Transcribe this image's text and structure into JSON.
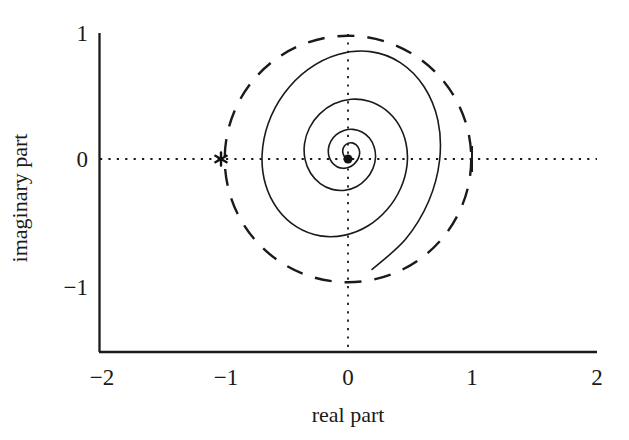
{
  "chart_data": {
    "type": "line",
    "title": "",
    "xlabel": "real part",
    "ylabel": "imaginary part",
    "xlim": [
      -2,
      2
    ],
    "ylim": [
      -1.53,
      1
    ],
    "xticks": [
      -2,
      -1,
      0,
      1,
      2
    ],
    "xtick_labels": [
      "−2",
      "−1",
      "0",
      "1",
      "2"
    ],
    "yticks": [
      -1,
      0,
      1
    ],
    "ytick_labels": [
      "−1",
      "0",
      "1"
    ],
    "grid": false,
    "legend": null,
    "series": [
      {
        "name": "logarithmic spiral (root locus)",
        "style": "solid",
        "color": "#1a1a1a",
        "linewidth": 1.6,
        "description": "Spiral winding outward counter-clockwise from the origin, crossing the unit circle near (-0.69, -0.72) and exiting the bottom of the axes at about (-1.23, -1.53)",
        "points": [
          [
            0.0,
            0.0
          ],
          [
            -0.022,
            0.012
          ],
          [
            -0.038,
            0.038
          ],
          [
            -0.042,
            0.071
          ],
          [
            -0.029,
            0.103
          ],
          [
            -0.002,
            0.124
          ],
          [
            0.033,
            0.128
          ],
          [
            0.066,
            0.112
          ],
          [
            0.088,
            0.08
          ],
          [
            0.093,
            0.04
          ],
          [
            0.079,
            -0.002
          ],
          [
            0.049,
            -0.04
          ],
          [
            0.007,
            -0.066
          ],
          [
            -0.04,
            -0.074
          ],
          [
            -0.088,
            -0.061
          ],
          [
            -0.128,
            -0.028
          ],
          [
            -0.153,
            0.022
          ],
          [
            -0.157,
            0.082
          ],
          [
            -0.137,
            0.142
          ],
          [
            -0.094,
            0.194
          ],
          [
            -0.032,
            0.227
          ],
          [
            0.04,
            0.235
          ],
          [
            0.112,
            0.214
          ],
          [
            0.172,
            0.166
          ],
          [
            0.21,
            0.095
          ],
          [
            0.221,
            0.012
          ],
          [
            0.2,
            -0.076
          ],
          [
            0.148,
            -0.157
          ],
          [
            0.071,
            -0.218
          ],
          [
            -0.024,
            -0.248
          ],
          [
            -0.127,
            -0.241
          ],
          [
            -0.223,
            -0.195
          ],
          [
            -0.3,
            -0.113
          ],
          [
            -0.345,
            -0.003
          ],
          [
            -0.349,
            0.122
          ],
          [
            -0.309,
            0.248
          ],
          [
            -0.227,
            0.358
          ],
          [
            -0.112,
            0.438
          ],
          [
            0.026,
            0.474
          ],
          [
            0.169,
            0.459
          ],
          [
            0.3,
            0.392
          ],
          [
            0.405,
            0.277
          ],
          [
            0.466,
            0.125
          ],
          [
            0.474,
            -0.05
          ],
          [
            0.423,
            -0.232
          ],
          [
            0.316,
            -0.399
          ],
          [
            0.162,
            -0.53
          ],
          [
            -0.024,
            -0.604
          ],
          [
            -0.222,
            -0.61
          ],
          [
            -0.409,
            -0.541
          ],
          [
            -0.563,
            -0.401
          ],
          [
            -0.662,
            -0.203
          ],
          [
            -0.69,
            0.033
          ],
          [
            -0.64,
            0.284
          ],
          [
            -0.513,
            0.52
          ],
          [
            -0.32,
            0.712
          ],
          [
            -0.08,
            0.83
          ],
          [
            0.18,
            0.852
          ],
          [
            0.42,
            0.765
          ],
          [
            0.61,
            0.575
          ],
          [
            0.722,
            0.306
          ],
          [
            0.736,
            -0.008
          ],
          [
            0.648,
            -0.335
          ],
          [
            0.462,
            -0.637
          ],
          [
            0.193,
            -0.877
          ]
        ]
      },
      {
        "name": "unit circle",
        "style": "dashed",
        "color": "#1a1a1a",
        "linewidth": 2.2,
        "radius": 0.99,
        "center": [
          0.0,
          0.0
        ]
      },
      {
        "name": "real axis crosshair",
        "style": "dotted",
        "color": "#1a1a1a",
        "linewidth": 1.6,
        "y": 0.0
      },
      {
        "name": "imaginary axis crosshair",
        "style": "dotted",
        "color": "#1a1a1a",
        "linewidth": 1.6,
        "x": 0.0
      }
    ],
    "markers": [
      {
        "name": "open-loop-pole",
        "glyph": "asterisk",
        "x": -1.02,
        "y": 0.0,
        "color": "#111111",
        "size": 13
      },
      {
        "name": "origin-point",
        "glyph": "filled-circle",
        "x": 0.0,
        "y": 0.0,
        "color": "#111111",
        "size": 9
      }
    ],
    "annotations": []
  },
  "axes": {
    "x_title": "real part",
    "y_title": "imaginary part",
    "x_tick_labels": [
      "−2",
      "−1",
      "0",
      "1",
      "2"
    ],
    "y_tick_labels": [
      "1",
      "0",
      "−1"
    ],
    "spine_color": "#1a1a1a"
  }
}
